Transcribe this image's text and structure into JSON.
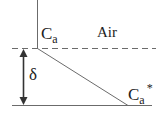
{
  "diagram": {
    "region_label": "Air",
    "top_concentration": {
      "symbol": "C",
      "subscript": "a"
    },
    "bottom_concentration": {
      "symbol": "C",
      "subscript": "a",
      "superscript": "*"
    },
    "thickness_label": "δ",
    "colors": {
      "lines": "#6b6b6b",
      "arrow": "#333333",
      "text": "#222222"
    }
  }
}
